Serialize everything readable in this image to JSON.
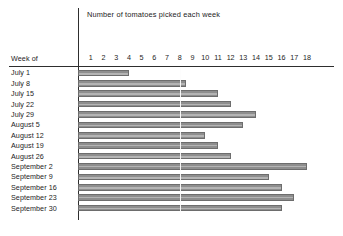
{
  "chart_data": {
    "type": "bar",
    "orientation": "horizontal",
    "title": "Number of tomatoes picked each week",
    "xlabel": "",
    "ylabel": "Week of",
    "categories": [
      "July 1",
      "July 8",
      "July 15",
      "July 22",
      "July 29",
      "August 5",
      "August 12",
      "August 19",
      "August 26",
      "September 2",
      "September 9",
      "September 16",
      "September 23",
      "September 30"
    ],
    "values": [
      4,
      8.5,
      11,
      12,
      14,
      13,
      10,
      11,
      12,
      18,
      15,
      16,
      17,
      16
    ],
    "xticks": [
      1,
      2,
      3,
      4,
      5,
      6,
      7,
      8,
      9,
      10,
      11,
      12,
      13,
      14,
      15,
      16,
      17,
      18
    ],
    "xlim": [
      0,
      18
    ],
    "grid": false,
    "gridline_at": 8,
    "legend": null,
    "bar_color": "#a0a0a0",
    "bar_border_color": "#6d6d6d",
    "axis_color": "#2e2e2e",
    "text_color": "#1c1c1c",
    "background_color": "#ffffff"
  },
  "axis": {
    "row_header": "Week of"
  }
}
